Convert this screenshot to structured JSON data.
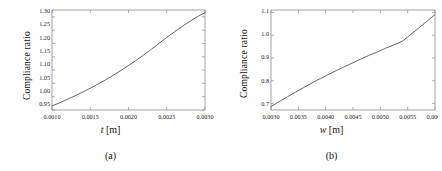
{
  "figure": {
    "background": "#ffffff",
    "curve_color": "#555555",
    "frame_color": "#8c8c8c"
  },
  "panels": [
    {
      "id": "panel-a",
      "subcaption": "(a)",
      "ylabel": "Compliance ratio",
      "xlabel_var": "t",
      "xlabel_unit": "[m]"
    },
    {
      "id": "panel-b",
      "subcaption": "(b)",
      "ylabel": "Compliance ratio",
      "xlabel_var": "w",
      "xlabel_unit": "[m]"
    }
  ],
  "chart_data": [
    {
      "type": "line",
      "panel": "(a)",
      "title": "",
      "xlabel": "t [m]",
      "ylabel": "Compliance ratio",
      "xlim": [
        0.001,
        0.003
      ],
      "ylim": [
        0.95,
        1.325
      ],
      "grid": false,
      "legend": null,
      "xticks": [
        0.001,
        0.0015,
        0.002,
        0.0025,
        0.003
      ],
      "xticklabels": [
        "0.0010",
        "0.0015",
        "0.0020",
        "0.0025",
        "0.0030"
      ],
      "yticks": [
        0.95,
        1.0,
        1.05,
        1.1,
        1.15,
        1.2,
        1.25,
        1.3
      ],
      "yticklabels": [
        "0.95",
        "1.00",
        "1.05",
        "1.10",
        "1.15",
        "1.20",
        "1.25",
        "1.30"
      ],
      "series": [
        {
          "name": "compliance ratio vs t",
          "x": [
            0.001,
            0.0011,
            0.0012,
            0.0013,
            0.0014,
            0.0015,
            0.0016,
            0.0017,
            0.0018,
            0.0019,
            0.002,
            0.0021,
            0.0022,
            0.0023,
            0.0024,
            0.0025,
            0.0026,
            0.0027,
            0.0028,
            0.0029,
            0.003
          ],
          "y": [
            0.965,
            0.977,
            0.99,
            1.003,
            1.017,
            1.032,
            1.047,
            1.063,
            1.08,
            1.098,
            1.117,
            1.136,
            1.157,
            1.178,
            1.2,
            1.222,
            1.243,
            1.263,
            1.282,
            1.3,
            1.315
          ]
        }
      ]
    },
    {
      "type": "line",
      "panel": "(b)",
      "title": "",
      "xlabel": "w [m]",
      "ylabel": "Compliance ratio",
      "xlim": [
        0.003,
        0.006
      ],
      "ylim": [
        0.665,
        1.105
      ],
      "grid": false,
      "legend": null,
      "xticks": [
        0.003,
        0.0035,
        0.004,
        0.0045,
        0.005,
        0.0055,
        0.006
      ],
      "xticklabels": [
        "0.0030",
        "0.0035",
        "0.0040",
        "0.0045",
        "0.0050",
        "0.0055",
        "0.0060"
      ],
      "yticks": [
        0.7,
        0.8,
        0.9,
        1.0,
        1.1
      ],
      "yticklabels": [
        "0.7",
        "0.8",
        "0.9",
        "1.0",
        "1.1"
      ],
      "series": [
        {
          "name": "compliance ratio vs w",
          "x": [
            0.003,
            0.00315,
            0.0033,
            0.00345,
            0.0036,
            0.00375,
            0.0039,
            0.00405,
            0.0042,
            0.00435,
            0.0045,
            0.00465,
            0.0048,
            0.00495,
            0.0051,
            0.00525,
            0.0054,
            0.00555,
            0.0057,
            0.00585,
            0.006
          ],
          "y": [
            0.68,
            0.702,
            0.723,
            0.744,
            0.764,
            0.784,
            0.803,
            0.821,
            0.839,
            0.856,
            0.873,
            0.89,
            0.906,
            0.921,
            0.937,
            0.952,
            0.967,
            0.996,
            1.025,
            1.055,
            1.085
          ]
        }
      ]
    }
  ]
}
